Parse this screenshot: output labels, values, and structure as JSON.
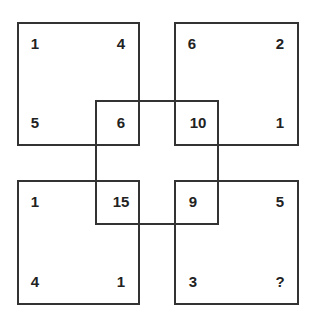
{
  "puzzle": {
    "description": "Number puzzle with four corner squares overlapping a central square",
    "top_left": {
      "tl": "1",
      "tr": "4",
      "bl": "5",
      "br": "6"
    },
    "top_right": {
      "tl": "6",
      "tr": "2",
      "bl": "10",
      "br": "1"
    },
    "bottom_left": {
      "tl": "1",
      "tr": "15",
      "bl": "4",
      "br": "1"
    },
    "bottom_right": {
      "tl": "9",
      "tr": "5",
      "bl": "3",
      "br": "?"
    },
    "line_color": "#333333",
    "text_color": "#222222"
  }
}
